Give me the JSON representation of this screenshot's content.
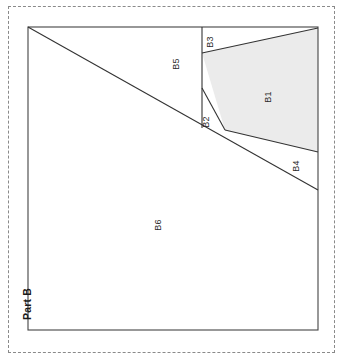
{
  "figure": {
    "part_label": "Part B",
    "outer_border_style": "dashed",
    "outer_border_color": "#8a8a8a",
    "inner_border_color": "#444444",
    "background_color": "#ffffff",
    "shaded_fill_color": "#ebebeb",
    "line_color": "#333333"
  },
  "regions": [
    {
      "id": "B1",
      "label": "B1",
      "shaded": true,
      "fill": "#ebebeb",
      "label_x": 268,
      "label_y": 97,
      "rotated": true,
      "polygon": "202,53 318,28 318,152 225,130"
    },
    {
      "id": "B2",
      "label": "B2",
      "shaded": false,
      "fill": "#ffffff",
      "label_x": 206,
      "label_y": 122,
      "rotated": true,
      "polygon": "202,88 225,130 202,128"
    },
    {
      "id": "B3",
      "label": "B3",
      "shaded": false,
      "fill": "#ffffff",
      "label_x": 210,
      "label_y": 42,
      "rotated": true,
      "polygon": "202,27 318,27 318,28 202,53"
    },
    {
      "id": "B4",
      "label": "B4",
      "shaded": false,
      "fill": "#ffffff",
      "label_x": 296,
      "label_y": 166,
      "rotated": true,
      "polygon": "225,130 318,152 318,190"
    },
    {
      "id": "B5",
      "label": "B5",
      "shaded": false,
      "fill": "#ffffff",
      "label_x": 176,
      "label_y": 64,
      "rotated": true,
      "polygon": "28,27 202,27 202,128 202,88"
    },
    {
      "id": "B6",
      "label": "B6",
      "shaded": false,
      "fill": "#ffffff",
      "label_x": 158,
      "label_y": 225,
      "rotated": true,
      "polygon": "28,27 318,190 318,330 28,330"
    }
  ],
  "geometry": {
    "inner_rect": {
      "x": 28,
      "y": 27,
      "width": 290,
      "height": 303
    },
    "main_diagonal": {
      "x1": 28,
      "y1": 27,
      "x2": 318,
      "y2": 190
    },
    "vertical_divider": {
      "x": 202,
      "y1": 27,
      "y2": 128
    },
    "b3_diagonal": {
      "x1": 202,
      "y1": 53,
      "x2": 318,
      "y2": 28
    },
    "b1_bottom": {
      "x1": 225,
      "y1": 130,
      "x2": 318,
      "y2": 152
    },
    "b2_slant": {
      "x1": 202,
      "y1": 88,
      "x2": 225,
      "y2": 130
    }
  }
}
